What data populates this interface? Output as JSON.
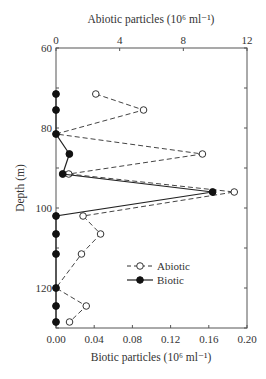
{
  "chart_data": {
    "type": "line",
    "orientation": "depth-profile",
    "title": "",
    "top_axis_label": "Abiotic particles (10⁶ ml⁻¹)",
    "bottom_axis_label": "Biotic particles (10⁶ ml⁻¹)",
    "ylabel": "Depth (m)",
    "y_inverted": true,
    "ylim": [
      60,
      130
    ],
    "y_ticks": [
      60,
      80,
      100,
      120
    ],
    "y_minor_step": 10,
    "top_xlim": [
      0,
      12
    ],
    "top_x_ticks": [
      "0",
      "4",
      "8",
      "12"
    ],
    "bottom_xlim": [
      0,
      0.2
    ],
    "bottom_x_ticks": [
      "0.00",
      "0.04",
      "0.08",
      "0.12",
      "0.16",
      "0.20"
    ],
    "grid": false,
    "legend_position": "lower-center-right inside plot",
    "series": [
      {
        "name": "Abiotic",
        "axis": "top",
        "style": "dashed, open circle",
        "depth": [
          71.5,
          75.5,
          81.5,
          86.5,
          91.5,
          96,
          102,
          106.5,
          111.5,
          120,
          124.5,
          128.5
        ],
        "values": [
          2.5,
          5.5,
          0.0,
          9.2,
          0.8,
          11.2,
          1.7,
          2.8,
          1.6,
          0.0,
          1.9,
          0.85
        ]
      },
      {
        "name": "Biotic",
        "axis": "bottom",
        "style": "solid, filled circle",
        "depth": [
          71.5,
          75.5,
          81.5,
          86.5,
          91.5,
          96,
          102,
          106.5,
          111.5,
          120,
          124.5,
          128.5
        ],
        "values": [
          0.0,
          0.0,
          0.0,
          0.014,
          0.007,
          0.164,
          0.0,
          0.0,
          0.0,
          0.0,
          0.0,
          0.0
        ]
      }
    ]
  },
  "legend": {
    "abiotic_label": "Abiotic",
    "biotic_label": "Biotic"
  }
}
